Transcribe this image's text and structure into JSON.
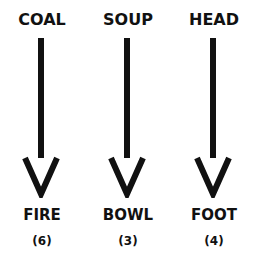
{
  "puzzle": {
    "columns": [
      {
        "top": "COAL",
        "bottom": "FIRE",
        "count": "(6)"
      },
      {
        "top": "SOUP",
        "bottom": "BOWL",
        "count": "(3)"
      },
      {
        "top": "HEAD",
        "bottom": "FOOT",
        "count": "(4)"
      }
    ],
    "arrow_color": "#111111"
  }
}
